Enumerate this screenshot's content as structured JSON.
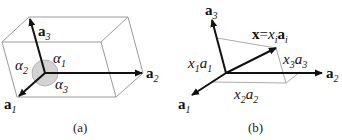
{
  "panel_a": {
    "caption": "(a)",
    "vectors": [
      {
        "name": "a",
        "sub": "1"
      },
      {
        "name": "a",
        "sub": "2"
      },
      {
        "name": "a",
        "sub": "3"
      }
    ],
    "angles": [
      {
        "name": "α",
        "sub": "1"
      },
      {
        "name": "α",
        "sub": "2"
      },
      {
        "name": "α",
        "sub": "3"
      }
    ]
  },
  "panel_b": {
    "caption": "(b)",
    "vectors": [
      {
        "name": "a",
        "sub": "1"
      },
      {
        "name": "a",
        "sub": "2"
      },
      {
        "name": "a",
        "sub": "3"
      }
    ],
    "x_label": {
      "lhs": "x",
      "eq": "=",
      "coef": "x",
      "coef_sub": "i",
      "vec": "a",
      "vec_sub": "i"
    },
    "components": [
      {
        "x": "x",
        "xsub": "1",
        "a": "a",
        "asub": "1"
      },
      {
        "x": "x",
        "xsub": "2",
        "a": "a",
        "asub": "2"
      },
      {
        "x": "x",
        "xsub": "3",
        "a": "a",
        "asub": "3"
      }
    ]
  },
  "colors": {
    "edge": "#9a9a9a",
    "arrow": "#111111",
    "circle_fill": "#d3d3d3",
    "circle_stroke": "#aaaaaa"
  }
}
